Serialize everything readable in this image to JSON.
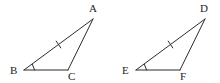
{
  "figure": {
    "type": "geometry-diagram",
    "background_color": "#ffffff",
    "stroke_color": "#2b2b2b",
    "label_color": "#1d1d1d",
    "stroke_width": 1
  },
  "shapes": [
    {
      "name": "triangle-abc",
      "vertices": [
        {
          "label": "A",
          "x": 93,
          "y": 19,
          "label_x": 89,
          "label_y": 12,
          "angle_mark": false
        },
        {
          "label": "B",
          "x": 24,
          "y": 70,
          "label_x": 10,
          "label_y": 74,
          "angle_mark": true
        },
        {
          "label": "C",
          "x": 68,
          "y": 70,
          "label_x": 68,
          "label_y": 80,
          "angle_mark": false
        }
      ],
      "edges": [
        {
          "name": "segment-ab",
          "from": "A",
          "to": "B",
          "ticks": 1
        },
        {
          "name": "segment-bc",
          "from": "B",
          "to": "C",
          "ticks": 0
        },
        {
          "name": "segment-ca",
          "from": "C",
          "to": "A",
          "ticks": 0
        }
      ]
    },
    {
      "name": "triangle-def",
      "vertices": [
        {
          "label": "D",
          "x": 205,
          "y": 19,
          "label_x": 200,
          "label_y": 12,
          "angle_mark": false
        },
        {
          "label": "E",
          "x": 136,
          "y": 70,
          "label_x": 122,
          "label_y": 74,
          "angle_mark": true
        },
        {
          "label": "F",
          "x": 180,
          "y": 70,
          "label_x": 180,
          "label_y": 80,
          "angle_mark": false
        }
      ],
      "edges": [
        {
          "name": "segment-de",
          "from": "D",
          "to": "E",
          "ticks": 1
        },
        {
          "name": "segment-ef",
          "from": "E",
          "to": "F",
          "ticks": 0
        },
        {
          "name": "segment-fd",
          "from": "F",
          "to": "D",
          "ticks": 0
        }
      ]
    }
  ],
  "labels": {
    "a": "A",
    "b": "B",
    "c": "C",
    "d": "D",
    "e": "E",
    "f": "F"
  }
}
